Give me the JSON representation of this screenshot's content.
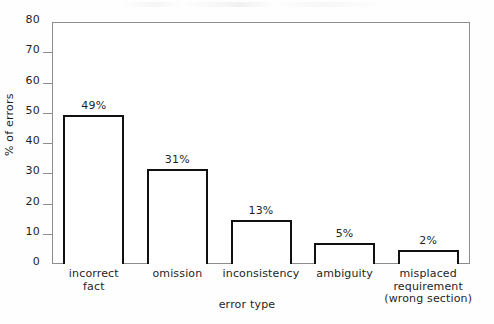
{
  "chart_data": {
    "type": "bar",
    "title": "",
    "subtitle": "",
    "xlabel": "error type",
    "ylabel": "% of errors",
    "categories": [
      "incorrect\nfact",
      "omission",
      "inconsistency",
      "ambiguity",
      "misplaced\nrequirement\n(wrong section)"
    ],
    "category_lines": [
      [
        "incorrect",
        "fact"
      ],
      [
        "omission"
      ],
      [
        "inconsistency"
      ],
      [
        "ambiguity"
      ],
      [
        "misplaced",
        "requirement",
        "(wrong section)"
      ]
    ],
    "values": [
      49,
      31,
      13,
      5,
      2
    ],
    "bar_tops": [
      49.3,
      31.3,
      14.5,
      7.0,
      4.5
    ],
    "data_labels": [
      "49%",
      "31%",
      "13%",
      "5%",
      "2%"
    ],
    "ylim": [
      0,
      80
    ],
    "yticks": [
      80,
      70,
      60,
      50,
      40,
      30,
      20,
      10,
      0
    ],
    "ytick_labels": [
      "80",
      "70",
      "60",
      "50",
      "40",
      "30",
      "20",
      "10",
      "0"
    ],
    "grid": false,
    "legend": null,
    "bar_fill_color": "#ffffff",
    "bar_edge_color": "#111111",
    "axis_color": "#8d8d8d",
    "text_color": "#1f1f1f",
    "background_color": "#ffffff"
  }
}
